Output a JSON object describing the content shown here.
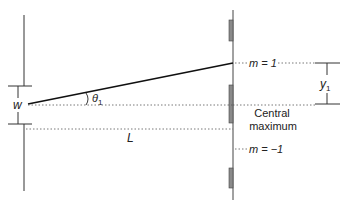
{
  "diagram": {
    "labels": {
      "slit_width": "w",
      "angle": "θ",
      "angle_sub": "1",
      "distance": "L",
      "order_plus": "m = 1",
      "order_minus": "m = −1",
      "central_line1": "Central",
      "central_line2": "maximum",
      "y_label": "y",
      "y_sub": "1"
    },
    "colors": {
      "line": "#222222",
      "screen_bright": "#8a8a8a",
      "dotted": "#555555"
    }
  }
}
